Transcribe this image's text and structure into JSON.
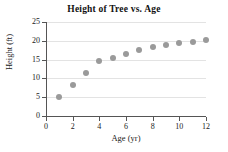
{
  "chart_data": {
    "type": "scatter",
    "title": "Height of Tree vs. Age",
    "xlabel": "Age (yr)",
    "ylabel": "Height (ft)",
    "xlim": [
      0,
      12
    ],
    "ylim": [
      0,
      25
    ],
    "xticks": [
      0,
      2,
      4,
      6,
      8,
      10,
      12
    ],
    "yticks": [
      0,
      5,
      10,
      15,
      20,
      25
    ],
    "xtick_labels": [
      "0",
      "2",
      "4",
      "6",
      "8",
      "10",
      "12"
    ],
    "ytick_labels": [
      "0",
      "5",
      "10",
      "15",
      "20",
      "25"
    ],
    "grid": "horizontal",
    "legend": "none",
    "marker_color": "#9a9a9a",
    "axis_color": "#555555",
    "gridline_color": "#e3e3e3",
    "x": [
      1,
      2,
      3,
      4,
      5,
      6,
      7,
      8,
      9,
      10,
      11,
      12
    ],
    "y": [
      5.0,
      8.3,
      11.5,
      14.6,
      15.4,
      16.5,
      17.5,
      18.4,
      19.0,
      19.5,
      19.8,
      20.1
    ],
    "points": [
      {
        "x": 1,
        "y": 5.0
      },
      {
        "x": 2,
        "y": 8.3
      },
      {
        "x": 3,
        "y": 11.5
      },
      {
        "x": 4,
        "y": 14.6
      },
      {
        "x": 5,
        "y": 15.4
      },
      {
        "x": 6,
        "y": 16.5
      },
      {
        "x": 7,
        "y": 17.5
      },
      {
        "x": 8,
        "y": 18.4
      },
      {
        "x": 9,
        "y": 19.0
      },
      {
        "x": 10,
        "y": 19.5
      },
      {
        "x": 11,
        "y": 19.8
      },
      {
        "x": 12,
        "y": 20.1
      }
    ]
  }
}
